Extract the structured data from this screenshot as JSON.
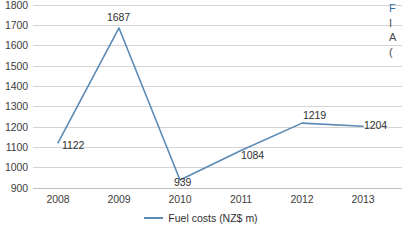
{
  "chart_data": {
    "type": "line",
    "title": "",
    "xlabel": "",
    "ylabel": "",
    "categories": [
      "2008",
      "2009",
      "2010",
      "2011",
      "2012",
      "2013"
    ],
    "series": [
      {
        "name": "Fuel costs (NZ$ m)",
        "color": "#5b8ab5",
        "values": [
          1122,
          1687,
          939,
          1084,
          1219,
          1204
        ],
        "point_labels": [
          "1122",
          "1687",
          "939",
          "1084",
          "1219",
          "1204"
        ]
      }
    ],
    "ylim": [
      900,
      1800
    ],
    "ytick_step": 100,
    "yticks": [
      "1800",
      "1700",
      "1600",
      "1500",
      "1400",
      "1300",
      "1200",
      "1100",
      "1000",
      "900"
    ],
    "grid": true,
    "grid_axis": "y",
    "legend": true,
    "legend_position": "bottom-center",
    "data_labels": true
  },
  "legend": {
    "entries": [
      {
        "label": "Fuel costs (NZ$ m)",
        "color": "#5b8ab5"
      }
    ]
  },
  "colors": {
    "series_line": "#5b8ab5",
    "gridline": "#d4d4d4",
    "axis_text": "#3d3d3d",
    "label_text": "#2f2f2f",
    "edge_accent": "#2f6fa8"
  },
  "edge_fragment": {
    "lines": [
      "F",
      "I",
      "A",
      "("
    ]
  }
}
